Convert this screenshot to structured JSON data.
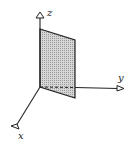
{
  "diagram": {
    "type": "3d-coordinate-axes-with-plane",
    "axes": {
      "z": {
        "label": "z"
      },
      "y": {
        "label": "y"
      },
      "x": {
        "label": "x"
      }
    },
    "plane": {
      "description": "shaded vertical plane in the yz-plane direction",
      "fill_color": "#c8c8c8",
      "edge_color": "#222222"
    },
    "colors": {
      "line": "#222222",
      "background": "#ffffff"
    }
  }
}
